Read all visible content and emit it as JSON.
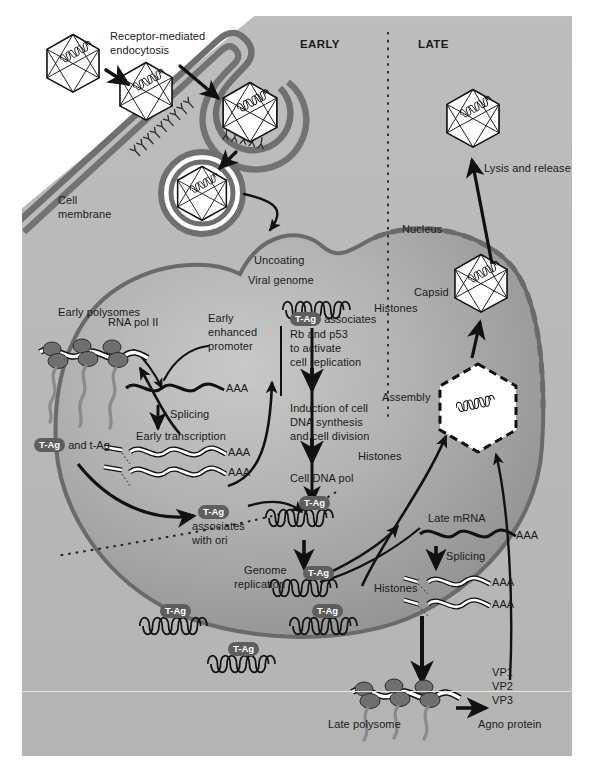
{
  "figure": {
    "domain_title": "Polyomavirus replication cycle",
    "background_outside": "#ffffff",
    "cytoplasm_color": "#b9b9b9",
    "extracellular_color": "#ffffff",
    "nucleus_color": "#9a9a9a",
    "membrane_color": "#7a7a7a",
    "text_color": "#1a1a1a",
    "tag_pill_color": "#5e5e5e",
    "tag_pill_text": "#ffffff"
  },
  "phase_labels": {
    "early": "EARLY",
    "late": "LATE"
  },
  "labels": {
    "receptor_endocytosis_l1": "Receptor-mediated",
    "receptor_endocytosis_l2": "endocytosis",
    "cell_membrane_l1": "Cell",
    "cell_membrane_l2": "membrane",
    "uncoating": "Uncoating",
    "viral_genome": "Viral genome",
    "histones_top": "Histones",
    "nucleus": "Nucleus",
    "lysis_and_release": "Lysis and release",
    "capsid": "Capsid",
    "assembly": "Assembly",
    "rna_pol_ii": "RNA pol II",
    "early_enhanced_promoter_l1": "Early",
    "early_enhanced_promoter_l2": "enhanced",
    "early_enhanced_promoter_l3": "promoter",
    "aaa_1": "AAA",
    "splicing_early": "Splicing",
    "early_transcription": "Early transcription",
    "aaa_2": "AAA",
    "aaa_3": "AAA",
    "early_polysomes": "Early polysomes",
    "t_ag_and_t_ag_suffix": " and t-Ag",
    "t_ag_pill": "T-Ag",
    "associates_with_ori_l1": "associates",
    "associates_with_ori_l2": "with ori",
    "tag_associates_suffix": " associates",
    "rb_and_p53": "Rb and p53",
    "to_activate": "to activate",
    "cell_replication": "cell replication",
    "induction_l1": "Induction of cell",
    "induction_l2": "DNA synthesis",
    "induction_l3": "and cell division",
    "cell_dna_pol": "Cell DNA pol",
    "genome_replication_l1": "Genome",
    "genome_replication_l2": "replication",
    "histones_mid": "Histones",
    "histones_assembly": "Histones",
    "late_mrna": "Late mRNA",
    "aaa_late_1": "AAA",
    "splicing_late": "Splicing",
    "aaa_late_2": "AAA",
    "aaa_late_3": "AAA",
    "late_polysome": "Late polysome",
    "vp1": "VP1",
    "vp2": "VP2",
    "vp3": "VP3",
    "agno_protein": "Agno protein"
  },
  "tag_pills": {
    "pill_text": "T-Ag",
    "genome_pills_count": 6
  },
  "structures": {
    "virions_extracellular": 2,
    "virion_in_pit": 1,
    "virion_in_vesicle": 1,
    "virion_released": 1,
    "virion_in_nucleus_exiting": 1,
    "capsid_assembled": 1,
    "capsid_assembling_dashed": 1,
    "genome_coils_top": 1,
    "genome_coils_replicating": 6
  }
}
